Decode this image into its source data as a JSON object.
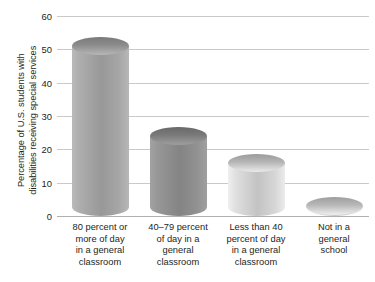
{
  "chart_data": {
    "type": "bar",
    "title": "",
    "subtitle": "",
    "xlabel": "",
    "ylabel": "Percentage of U.S. students with disabilities receiving special services",
    "ylabel_lines": [
      "Percentage of U.S. students with",
      "disabilities receiving special services"
    ],
    "categories": [
      "80 percent or more of day in a general classroom",
      "40–79 percent of day in a general classroom",
      "Less than 40 percent of day in a general classroom",
      "Not in a general school"
    ],
    "category_lines": [
      [
        "80 percent or",
        "more of day",
        "in a general",
        "classroom"
      ],
      [
        "40–79 percent",
        "of day in a",
        "general",
        "classroom"
      ],
      [
        "Less than 40",
        "percent of day",
        "in a general",
        "classroom"
      ],
      [
        "Not in a",
        "general",
        "school"
      ]
    ],
    "values": [
      51,
      24,
      16,
      3
    ],
    "ylim": [
      0,
      60
    ],
    "yticks": [
      0,
      10,
      20,
      30,
      40,
      50,
      60
    ],
    "ytick_labels": [
      "0",
      "10",
      "20",
      "30",
      "40",
      "50",
      "60"
    ],
    "grid": true,
    "legend": false,
    "legend_position": "none",
    "bar_style": "3d-cylinder",
    "bar_colors": [
      "#a3a3a3",
      "#8e8e8e",
      "#d2d2d2",
      "#d6d6d6"
    ],
    "gridline_color": "#c9c9c9",
    "text_color": "#231f20",
    "background_color": "#ffffff"
  }
}
